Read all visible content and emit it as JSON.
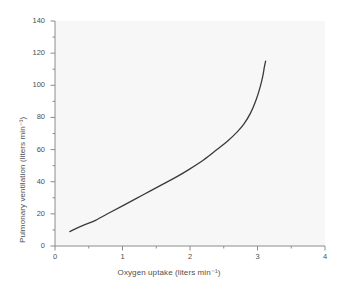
{
  "chart_data": {
    "type": "line",
    "title": "",
    "xlabel": "Oxygen uptake (liters min⁻¹)",
    "ylabel": "Pulmonary ventilation (liters min⁻¹)",
    "xlim": [
      0,
      4
    ],
    "ylim": [
      0,
      140
    ],
    "xticks": [
      0,
      1,
      2,
      3,
      4
    ],
    "xtick_labels": [
      "0",
      "1",
      "2",
      "3",
      "4"
    ],
    "yticks": [
      0,
      20,
      40,
      60,
      80,
      100,
      120,
      140
    ],
    "ytick_labels": [
      "0",
      "20",
      "40",
      "60",
      "80",
      "100",
      "120",
      "140"
    ],
    "x_minor_step": 0.5,
    "y_minor_step": 10,
    "grid": false,
    "legend": "none",
    "series": [
      {
        "name": "Pulmonary ventilation vs oxygen uptake",
        "color": "#3a3a3a",
        "line_width": 1.3,
        "x": [
          0.22,
          0.4,
          0.6,
          0.8,
          1.0,
          1.2,
          1.4,
          1.6,
          1.8,
          2.0,
          2.2,
          2.4,
          2.55,
          2.7,
          2.8,
          2.9,
          2.98,
          3.04,
          3.08,
          3.1,
          3.12
        ],
        "y": [
          9,
          12.5,
          16,
          20.5,
          25,
          29.5,
          34,
          38.5,
          43,
          48,
          53.5,
          60,
          65,
          71,
          76,
          83,
          91,
          99,
          106,
          111,
          115
        ]
      }
    ]
  },
  "axes": {
    "x_title": "Oxygen uptake (liters min⁻¹)",
    "y_title": "Pulmonary ventilation (liters min⁻¹)"
  },
  "style": {
    "plot_background": "#f7f7f7",
    "page_background": "#ffffff",
    "axis_color": "#8c8c8c",
    "text_color": "#4f4f4f",
    "curve_color": "#3a3a3a"
  }
}
